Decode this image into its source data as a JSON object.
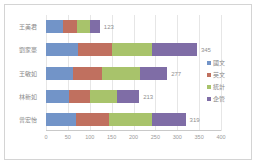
{
  "chart_data": {
    "type": "bar",
    "orientation": "horizontal",
    "stacked": true,
    "title": "",
    "xlabel": "",
    "ylabel": "",
    "xlim": [
      0,
      400
    ],
    "grid": true,
    "legend_position": "right",
    "categories": [
      "王美君",
      "劉家豪",
      "王敏如",
      "林新如",
      "曾宏怡"
    ],
    "ticks": [
      "0",
      "50",
      "100",
      "150",
      "200",
      "250",
      "300",
      "350",
      "400"
    ],
    "tick_values": [
      0,
      50,
      100,
      150,
      200,
      250,
      300,
      350,
      400
    ],
    "series": [
      {
        "name": "國文",
        "color": "#7294c8",
        "values": [
          38,
          72,
          62,
          52,
          68
        ]
      },
      {
        "name": "英文",
        "color": "#c0705f",
        "values": [
          32,
          78,
          66,
          48,
          76
        ]
      },
      {
        "name": "統計",
        "color": "#a8c36b",
        "values": [
          30,
          92,
          86,
          62,
          98
        ]
      },
      {
        "name": "企管",
        "color": "#7f6da6",
        "values": [
          23,
          103,
          63,
          51,
          77
        ]
      }
    ],
    "totals": [
      123,
      345,
      277,
      213,
      319
    ],
    "total_labels": [
      "123",
      "345",
      "277",
      "213",
      "319"
    ]
  },
  "legend": {
    "items": [
      {
        "label": "國文",
        "color": "#7294c8"
      },
      {
        "label": "英文",
        "color": "#c0705f"
      },
      {
        "label": "統計",
        "color": "#a8c36b"
      },
      {
        "label": "企管",
        "color": "#7f6da6"
      }
    ]
  },
  "colors": {
    "series_1": "#7294c8",
    "series_2": "#c0705f",
    "series_3": "#a8c36b",
    "series_4": "#7f6da6",
    "gridline": "#e6e6e6",
    "axis_text": "#9a9a9a",
    "frame": "#d4d4d4"
  }
}
